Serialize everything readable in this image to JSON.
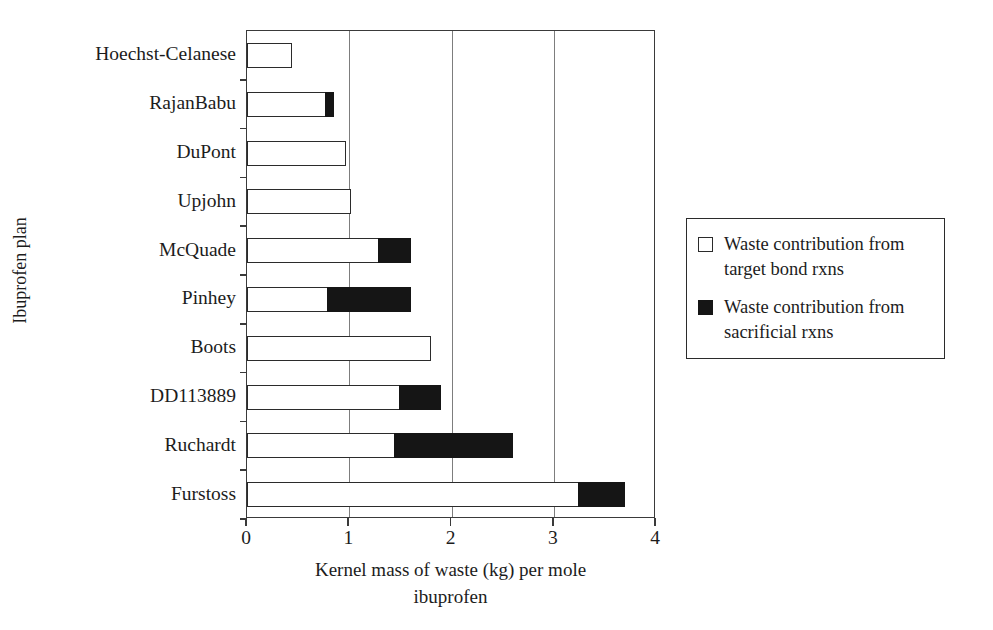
{
  "chart_data": {
    "type": "bar",
    "orientation": "horizontal",
    "stacked": true,
    "title": "",
    "xlabel": "Kernel mass of waste (kg) per mole ibuprofen",
    "xlabel_lines": [
      "Kernel mass of waste (kg) per mole",
      "ibuprofen"
    ],
    "ylabel": "Ibuprofen plan",
    "xlim": [
      0,
      4
    ],
    "xticks": [
      0,
      1,
      2,
      3,
      4
    ],
    "xticklabels": [
      "0",
      "1",
      "2",
      "3",
      "4"
    ],
    "grid": "vertical gridlines at x = 1, 2, 3",
    "legend_position": "right",
    "categories": [
      "Hoechst-Celanese",
      "RajanBabu",
      "DuPont",
      "Upjohn",
      "McQuade",
      "Pinhey",
      "Boots",
      "DD113889",
      "Ruchardt",
      "Furstoss"
    ],
    "series": [
      {
        "name": "Waste contribution from target bond rxns",
        "color": "#ffffff",
        "edge": "#2b2b2b",
        "values": [
          0.44,
          0.78,
          0.97,
          1.02,
          1.3,
          0.8,
          1.8,
          1.5,
          1.45,
          3.25
        ]
      },
      {
        "name": "Waste contribution from sacrificial rxns",
        "color": "#151515",
        "edge": "#151515",
        "values": [
          0,
          0.07,
          0,
          0,
          0.3,
          0.8,
          0,
          0.4,
          1.15,
          0.45
        ]
      }
    ],
    "totals": [
      0.44,
      0.85,
      0.97,
      1.02,
      1.6,
      1.6,
      1.8,
      1.9,
      2.6,
      3.7
    ]
  },
  "legend": {
    "items": [
      {
        "swatch": "open-square-marker",
        "line1": "Waste contribution from",
        "line2": "target bond rxns"
      },
      {
        "swatch": "filled-square-marker",
        "line1": "Waste contribution from",
        "line2": "sacrificial rxns"
      }
    ]
  },
  "colors": {
    "target_bond": "#ffffff",
    "sacrificial": "#151515",
    "axis": "#3a3a3a",
    "grid": "#7d7d7d",
    "text": "#1c1c1c",
    "background": "#ffffff"
  }
}
